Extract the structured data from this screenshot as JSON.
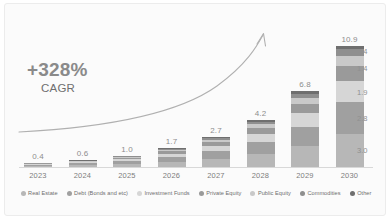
{
  "chart_data": {
    "type": "bar",
    "subtype": "stacked-bar",
    "title": "",
    "xlabel": "",
    "ylabel": "",
    "grid": false,
    "legend_position": "bottom",
    "categories": [
      "2023",
      "2024",
      "2025",
      "2026",
      "2027",
      "2028",
      "2029",
      "2030"
    ],
    "totals": [
      "0.4",
      "0.6",
      "1.0",
      "1.7",
      "2.7",
      "4.2",
      "6.8",
      "10.9"
    ],
    "totals_numeric": [
      0.4,
      0.6,
      1.0,
      1.7,
      2.7,
      4.2,
      6.8,
      10.9
    ],
    "ylim": [
      0,
      11.5
    ],
    "series": [
      {
        "name": "Real Estate",
        "color": "#b7b7b7",
        "values": [
          0.12,
          0.17,
          0.28,
          0.47,
          0.75,
          1.16,
          1.88,
          3.0
        ]
      },
      {
        "name": "Debt (Bonds and etc)",
        "color": "#a0a0a0",
        "values": [
          0.1,
          0.15,
          0.26,
          0.44,
          0.7,
          1.08,
          1.75,
          2.8
        ]
      },
      {
        "name": "Investment Funds",
        "color": "#d6d6d6",
        "values": [
          0.07,
          0.1,
          0.17,
          0.29,
          0.47,
          0.73,
          1.19,
          1.9
        ]
      },
      {
        "name": "Private Equity",
        "color": "#9a9a9a",
        "values": [
          0.05,
          0.07,
          0.12,
          0.21,
          0.33,
          0.52,
          0.84,
          1.4
        ]
      },
      {
        "name": "Public Equity",
        "color": "#c9c9c9",
        "values": [
          0.03,
          0.05,
          0.08,
          0.14,
          0.22,
          0.34,
          0.56,
          0.9
        ]
      },
      {
        "name": "Commodities",
        "color": "#8f8f8f",
        "values": [
          0.02,
          0.03,
          0.05,
          0.09,
          0.14,
          0.22,
          0.35,
          0.6
        ]
      },
      {
        "name": "Other",
        "color": "#6f6f6f",
        "values": [
          0.01,
          0.03,
          0.04,
          0.06,
          0.09,
          0.15,
          0.23,
          0.3
        ]
      }
    ],
    "segment_callouts_2030": [
      "1.4",
      "1.4",
      "1.9",
      "2.8",
      "3.0"
    ],
    "annotation": {
      "value": "+328%",
      "label": "CAGR",
      "arrow": "curved-upward-arrow"
    }
  },
  "legend": {
    "items": [
      {
        "label": "Real Estate",
        "color": "#b7b7b7"
      },
      {
        "label": "Debt (Bonds and etc)",
        "color": "#a0a0a0"
      },
      {
        "label": "Investment Funds",
        "color": "#d6d6d6"
      },
      {
        "label": "Private Equity",
        "color": "#9a9a9a"
      },
      {
        "label": "Public Equity",
        "color": "#c9c9c9"
      },
      {
        "label": "Commodities",
        "color": "#8f8f8f"
      },
      {
        "label": "Other",
        "color": "#6f6f6f"
      }
    ]
  }
}
